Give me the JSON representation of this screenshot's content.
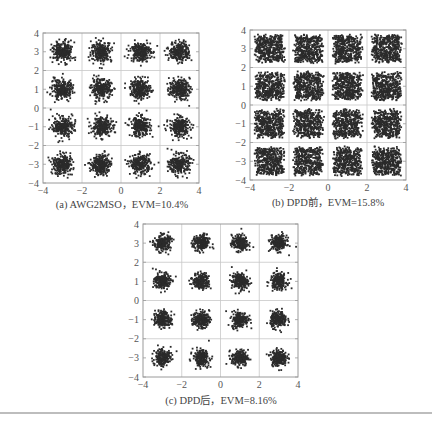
{
  "chart_data": [
    {
      "id": "a",
      "type": "scatter",
      "title": "(a) AWG2MSO, EVM=10.4%",
      "caption": "(a) AWG2MSO，EVM=10.4%",
      "xlabel": "",
      "ylabel": "",
      "xlim": [
        -4,
        4
      ],
      "ylim": [
        -4,
        4
      ],
      "xticks": [
        -4,
        -2,
        0,
        2,
        4
      ],
      "yticks": [
        -4,
        -3,
        -2,
        -1,
        0,
        1,
        2,
        3,
        4
      ],
      "grid": true,
      "constellation": "16QAM",
      "cluster_centers_x": [
        -3,
        -1,
        1,
        3
      ],
      "cluster_centers_y": [
        -3,
        -1,
        1,
        3
      ],
      "evm_percent": 10.4,
      "spread_sigma": 0.26,
      "points_per_cluster": 260,
      "box": {
        "left": 43,
        "top": 33,
        "width": 156,
        "height": 150
      }
    },
    {
      "id": "b",
      "type": "scatter",
      "title": "(b) DPD前, EVM=15.8%",
      "caption": "(b) DPD前，EVM=15.8%",
      "xlabel": "",
      "ylabel": "",
      "xlim": [
        -4,
        4
      ],
      "ylim": [
        -4,
        4
      ],
      "xticks": [
        -4,
        -2,
        0,
        2,
        4
      ],
      "yticks": [
        -4,
        -3,
        -2,
        -1,
        0,
        1,
        2,
        3,
        4
      ],
      "grid": true,
      "constellation": "16QAM",
      "cluster_centers_x": [
        -3,
        -1,
        1,
        3
      ],
      "cluster_centers_y": [
        -3,
        -1,
        1,
        3
      ],
      "evm_percent": 15.8,
      "spread_sigma": 0.4,
      "points_per_cluster": 420,
      "box": {
        "left": 250,
        "top": 30,
        "width": 156,
        "height": 150
      }
    },
    {
      "id": "c",
      "type": "scatter",
      "title": "(c) DPD后, EVM=8.16%",
      "caption": "(c) DPD后，EVM=8.16%",
      "xlabel": "",
      "ylabel": "",
      "xlim": [
        -4,
        4
      ],
      "ylim": [
        -4,
        4
      ],
      "xticks": [
        -4,
        -2,
        0,
        2,
        4
      ],
      "yticks": [
        -4,
        -3,
        -2,
        -1,
        0,
        1,
        2,
        3,
        4
      ],
      "grid": true,
      "constellation": "16QAM",
      "cluster_centers_x": [
        -3,
        -1,
        1,
        3
      ],
      "cluster_centers_y": [
        -3,
        -1,
        1,
        3
      ],
      "evm_percent": 8.16,
      "spread_sigma": 0.21,
      "points_per_cluster": 220,
      "box": {
        "left": 143,
        "top": 224,
        "width": 155,
        "height": 153
      }
    }
  ],
  "colors": {
    "points": "#2b2b2b",
    "axes": "#9a9a9a",
    "grid": "#c8c8c8",
    "tick_text": "#555555",
    "rule": "#bdbdbd"
  },
  "captions": {
    "a": "(a) AWG2MSO，EVM=10.4%",
    "b": "(b) DPD前，EVM=15.8%",
    "c": "(c) DPD后，EVM=8.16%"
  }
}
